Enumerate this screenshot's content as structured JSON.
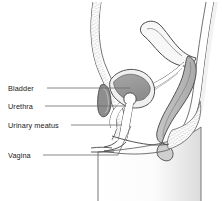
{
  "figure": {
    "background_color": "#ffffff",
    "line_color": "#3a3a3a",
    "label_color": "#1a1a1a",
    "width": 222,
    "height": 201
  },
  "labels": [
    {
      "id": "bladder",
      "text": "Bladder",
      "x": 8,
      "y": 91,
      "leader_x1": 47,
      "leader_y1": 88,
      "leader_x2": 130,
      "leader_y2": 88
    },
    {
      "id": "urethra",
      "text": "Urethra",
      "x": 8,
      "y": 109,
      "leader_x1": 45,
      "leader_y1": 106,
      "leader_x2": 126,
      "leader_y2": 106
    },
    {
      "id": "urinary-meatus",
      "text": "Urinary meatus",
      "x": 8,
      "y": 128,
      "leader_x1": 71,
      "leader_y1": 125,
      "leader_x2": 122,
      "leader_y2": 125
    },
    {
      "id": "vagina",
      "text": "Vagina",
      "x": 8,
      "y": 158,
      "leader_x1": 43,
      "leader_y1": 155,
      "leader_x2": 118,
      "leader_y2": 155
    }
  ],
  "structures": [
    {
      "id": "abdominal-wall",
      "name": "abdominal wall",
      "fill": "#ffffff",
      "texture": "stipple"
    },
    {
      "id": "bladder-organ",
      "name": "bladder",
      "fill": "#9a9a9a",
      "texture": "none"
    },
    {
      "id": "urethra-lumen",
      "name": "urethral lumen",
      "fill": "#ffffff",
      "texture": "none"
    },
    {
      "id": "uterus",
      "name": "uterus",
      "fill": "#f0f0f0",
      "texture": "none"
    },
    {
      "id": "rectum",
      "name": "rectum",
      "fill": "#bdbdbd",
      "texture": "none"
    },
    {
      "id": "anal-canal",
      "name": "anal canal",
      "fill": "#d2d2d2",
      "texture": "none"
    },
    {
      "id": "gluteal-fat",
      "name": "gluteal fat",
      "fill": "#ffffff",
      "texture": "stipple"
    },
    {
      "id": "thigh",
      "name": "thigh",
      "fill": "#f4f4f4",
      "texture": "gradient"
    },
    {
      "id": "vagina-canal",
      "name": "vaginal canal",
      "fill": "#ffffff",
      "texture": "none"
    }
  ]
}
